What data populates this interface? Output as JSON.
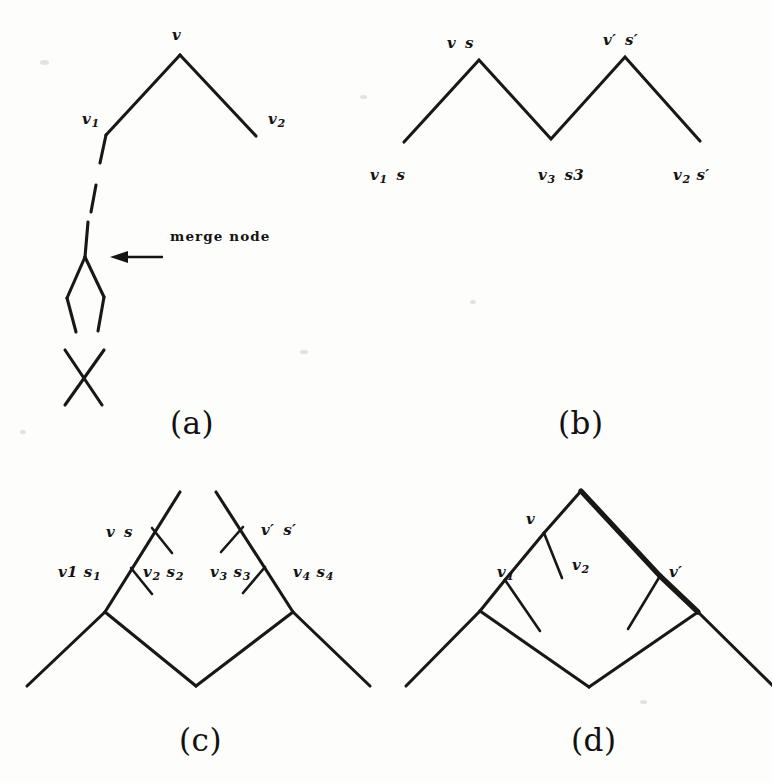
{
  "figure": {
    "background_color": "#fdfdfc",
    "ink_color": "#191816",
    "panels": [
      {
        "id": "a",
        "caption": "(a)",
        "annotation": "merge node",
        "labels": [
          "v",
          "v1",
          "v2"
        ]
      },
      {
        "id": "b",
        "caption": "(b)",
        "labels": [
          "v s",
          "v' s'",
          "v1 s",
          "v3 s3",
          "v2 s'"
        ]
      },
      {
        "id": "c",
        "caption": "(c)",
        "labels": [
          "v s",
          "v' s'",
          "v1 s1",
          "v2 s2",
          "v3 s3",
          "v4 s4"
        ]
      },
      {
        "id": "d",
        "caption": "(d)",
        "labels": [
          "v",
          "v1",
          "v2",
          "v'"
        ]
      }
    ]
  },
  "panel_a": {
    "caption": "(a)",
    "label_v": "v",
    "label_v1_base": "v",
    "label_v1_sub": "1",
    "label_v2_base": "v",
    "label_v2_sub": "2",
    "annotation": "merge node"
  },
  "panel_b": {
    "caption": "(b)",
    "label_top_left_v": "v",
    "label_top_left_s": "s",
    "label_top_right_v": "v",
    "label_top_right_vprime": "′",
    "label_top_right_s": "s",
    "label_top_right_sprime": "′",
    "label_bottom_left_v": "v",
    "label_bottom_left_sub": "1",
    "label_bottom_left_s": "s",
    "label_bottom_mid_v": "v",
    "label_bottom_mid_sub": "3",
    "label_bottom_mid_s": "s3",
    "label_bottom_right_v": "v",
    "label_bottom_right_sub": "2",
    "label_bottom_right_s": "s",
    "label_bottom_right_prime": "′"
  },
  "panel_c": {
    "caption": "(c)",
    "label_v": "v",
    "label_s": "s",
    "label_vprime": "v′",
    "label_sprime": "s′",
    "label_v1": "v1",
    "label_s1_base": "s",
    "label_s1_sub": "1",
    "label_v2_base": "v",
    "label_v2_sub": "2",
    "label_s2_base": "s",
    "label_s2_sub": "2",
    "label_v3_base": "v",
    "label_v3_sub": "3",
    "label_s3_base": "s",
    "label_s3_sub": "3",
    "label_v4_base": "v",
    "label_v4_sub": "4",
    "label_s4_base": "s",
    "label_s4_sub": "4"
  },
  "panel_d": {
    "caption": "(d)",
    "label_v": "v",
    "label_v1_base": "v",
    "label_v1_sub": "1",
    "label_v2_base": "v",
    "label_v2_sub": "2",
    "label_vprime": "v′"
  }
}
